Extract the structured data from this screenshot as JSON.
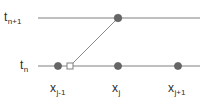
{
  "figure": {
    "kind": "finite-difference-stencil-diagram",
    "width": 209,
    "height": 101,
    "background_color": "#ffffff"
  },
  "colors": {
    "line": "#808080",
    "node_fill": "#666666",
    "node_stroke": "#555555",
    "open_marker_fill": "#ffffff",
    "open_marker_stroke": "#808080",
    "text": "#2b2b2b"
  },
  "time_levels": [
    {
      "id": "t-np1",
      "base": "t",
      "subscript": "n+1",
      "y": 18,
      "x_start": 38,
      "x_end": 200
    },
    {
      "id": "t-n",
      "base": "t",
      "subscript": "n",
      "y": 66,
      "x_start": 38,
      "x_end": 200
    }
  ],
  "space_nodes": [
    {
      "id": "x-jm1",
      "base": "x",
      "subscript": "j-1",
      "x": 58
    },
    {
      "id": "x-j",
      "base": "x",
      "subscript": "j",
      "x": 118
    },
    {
      "id": "x-jp1",
      "base": "x",
      "subscript": "j+1",
      "x": 178
    }
  ],
  "stencil_points": [
    {
      "id": "point-lower-jm1",
      "x": 58,
      "y": 66,
      "style": "filled",
      "radius": 3.6
    },
    {
      "id": "point-lower-j",
      "x": 118,
      "y": 66,
      "style": "filled",
      "radius": 3.6
    },
    {
      "id": "point-lower-jp1",
      "x": 178,
      "y": 66,
      "style": "filled",
      "radius": 3.6
    },
    {
      "id": "point-upper-j",
      "x": 118,
      "y": 18,
      "style": "filled",
      "radius": 3.8
    }
  ],
  "open_marker": {
    "id": "open-square-marker",
    "x": 70,
    "y": 66,
    "size": 6
  },
  "characteristic_line": {
    "id": "characteristic-segment",
    "x1": 70,
    "y1": 66,
    "x2": 118,
    "y2": 18
  }
}
